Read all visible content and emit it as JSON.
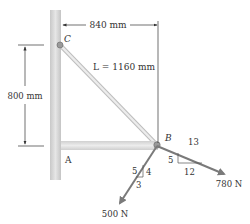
{
  "diagram": {
    "points": {
      "A": "A",
      "B": "B",
      "C": "C"
    },
    "dimensions": {
      "horizontal": "840 mm",
      "vertical": "800 mm",
      "length_label": "L = 1160 mm"
    },
    "forces": {
      "force_500": {
        "label": "500 N",
        "slope": {
          "hyp": "5",
          "vertical": "4",
          "horizontal": "3"
        }
      },
      "force_780": {
        "label": "780 N",
        "slope": {
          "hyp": "13",
          "vertical": "5",
          "horizontal": "12"
        }
      }
    },
    "colors": {
      "wall": "#d4d4d4",
      "member": "#e0e0e0",
      "arrow": "#7a7a7a",
      "text": "#333333"
    }
  }
}
